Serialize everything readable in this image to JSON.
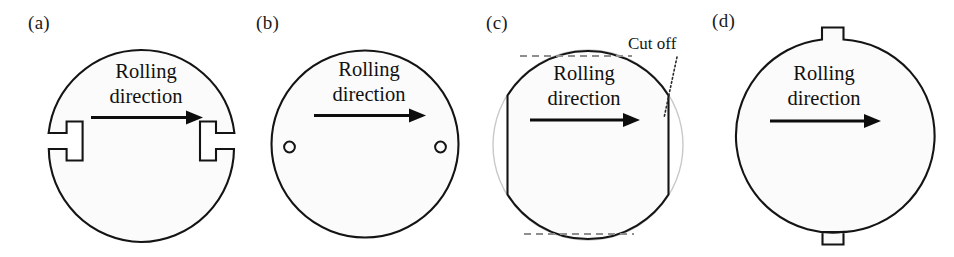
{
  "figure": {
    "caption_style": "four-panel schematic of rolled disc specimens",
    "background_color": "#ffffff",
    "line_color": "#141414",
    "fill_color": "#fbfbfb",
    "dashed_cut_color": "#8e8e8e",
    "width": 954,
    "height": 257
  },
  "panels": [
    {
      "id": "a",
      "label": "(a)",
      "shape": "disc-with-side-notches",
      "description": "circle with rectangular notches cut into left and right edges",
      "rolling_text_line1": "Rolling",
      "rolling_text_line2": "direction",
      "arrow_direction": "right"
    },
    {
      "id": "b",
      "label": "(b)",
      "shape": "disc-with-two-holes",
      "description": "circle with two small holes near left and right edges",
      "rolling_text_line1": "Rolling",
      "rolling_text_line2": "direction",
      "arrow_direction": "right"
    },
    {
      "id": "c",
      "label": "(c)",
      "shape": "disc-with-flat-cut-sides",
      "description": "circle with flattened cut-off left and right sides and dashed cut lines top and bottom",
      "rolling_text_line1": "Rolling",
      "rolling_text_line2": "direction",
      "arrow_direction": "right",
      "annotation": "Cut off"
    },
    {
      "id": "d",
      "label": "(d)",
      "shape": "disc-with-top-bottom-tabs",
      "description": "circle with rectangular tabs protruding at top and bottom",
      "rolling_text_line1": "Rolling",
      "rolling_text_line2": "direction",
      "arrow_direction": "right"
    }
  ]
}
